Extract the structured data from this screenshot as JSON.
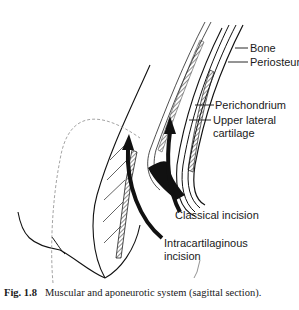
{
  "figure": {
    "labels": {
      "bone": "Bone",
      "periosteum": "Periosteum",
      "perichondrium": "Perichondrium",
      "upper_lateral_cartilage_line1": "Upper lateral",
      "upper_lateral_cartilage_line2": "cartilage",
      "classical_incision": "Classical incision",
      "intracartilaginous_line1": "Intracartilaginous",
      "intracartilaginous_line2": "incision"
    },
    "caption": {
      "number": "Fig. 1.8",
      "text": "Muscular and aponeurotic system (sagittal section)."
    },
    "colors": {
      "ink": "#111111",
      "dashed": "#9a9a9a",
      "background": "#ffffff"
    }
  }
}
